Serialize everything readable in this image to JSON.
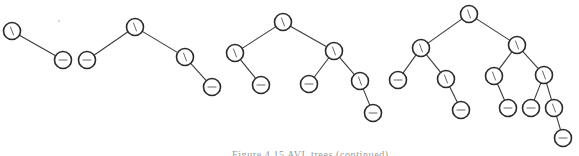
{
  "figure": {
    "caption": "Figure 4.15  AVL trees (continued)",
    "node_radius": 8.5,
    "colors": {
      "edge": "#3a3a3a",
      "node_stroke": "#2a2a2a",
      "node_fill": "#ffffff",
      "glyph": "#555555"
    },
    "glyph_legend": {
      "backslash": "right-heavy balance factor",
      "dash": "balanced"
    },
    "trees": [
      {
        "name": "tree-1",
        "nodes": [
          {
            "id": "t1-root",
            "x": 12,
            "y": 31,
            "glyph": "backslash"
          },
          {
            "id": "t1-r",
            "x": 63,
            "y": 60,
            "glyph": "dash"
          }
        ],
        "edges": [
          [
            "t1-root",
            "t1-r"
          ]
        ]
      },
      {
        "name": "tree-2",
        "nodes": [
          {
            "id": "t2-root",
            "x": 135,
            "y": 27,
            "glyph": "backslash"
          },
          {
            "id": "t2-l",
            "x": 87,
            "y": 60,
            "glyph": "dash"
          },
          {
            "id": "t2-r",
            "x": 185,
            "y": 57,
            "glyph": "backslash"
          },
          {
            "id": "t2-rr",
            "x": 212,
            "y": 87,
            "glyph": "dash"
          }
        ],
        "edges": [
          [
            "t2-root",
            "t2-l"
          ],
          [
            "t2-root",
            "t2-r"
          ],
          [
            "t2-r",
            "t2-rr"
          ]
        ]
      },
      {
        "name": "tree-3",
        "nodes": [
          {
            "id": "t3-root",
            "x": 283,
            "y": 22,
            "glyph": "backslash"
          },
          {
            "id": "t3-l",
            "x": 235,
            "y": 53,
            "glyph": "backslash"
          },
          {
            "id": "t3-lr",
            "x": 261,
            "y": 85,
            "glyph": "dash"
          },
          {
            "id": "t3-r",
            "x": 334,
            "y": 51,
            "glyph": "backslash"
          },
          {
            "id": "t3-rl",
            "x": 309,
            "y": 84,
            "glyph": "dash"
          },
          {
            "id": "t3-rr",
            "x": 360,
            "y": 81,
            "glyph": "backslash"
          },
          {
            "id": "t3-rrr",
            "x": 373,
            "y": 113,
            "glyph": "dash"
          }
        ],
        "edges": [
          [
            "t3-root",
            "t3-l"
          ],
          [
            "t3-l",
            "t3-lr"
          ],
          [
            "t3-root",
            "t3-r"
          ],
          [
            "t3-r",
            "t3-rl"
          ],
          [
            "t3-r",
            "t3-rr"
          ],
          [
            "t3-rr",
            "t3-rrr"
          ]
        ]
      },
      {
        "name": "tree-4",
        "nodes": [
          {
            "id": "t4-root",
            "x": 469,
            "y": 14,
            "glyph": "backslash"
          },
          {
            "id": "t4-l",
            "x": 421,
            "y": 48,
            "glyph": "backslash"
          },
          {
            "id": "t4-ll",
            "x": 398,
            "y": 80,
            "glyph": "dash"
          },
          {
            "id": "t4-lr",
            "x": 446,
            "y": 79,
            "glyph": "backslash"
          },
          {
            "id": "t4-lrr",
            "x": 461,
            "y": 110,
            "glyph": "dash"
          },
          {
            "id": "t4-r",
            "x": 517,
            "y": 45,
            "glyph": "backslash"
          },
          {
            "id": "t4-rl",
            "x": 494,
            "y": 76,
            "glyph": "backslash"
          },
          {
            "id": "t4-rlr",
            "x": 508,
            "y": 108,
            "glyph": "dash"
          },
          {
            "id": "t4-rr",
            "x": 544,
            "y": 75,
            "glyph": "backslash"
          },
          {
            "id": "t4-rrl",
            "x": 531,
            "y": 108,
            "glyph": "dash"
          },
          {
            "id": "t4-rrr",
            "x": 554,
            "y": 108,
            "glyph": "backslash"
          },
          {
            "id": "t4-rrrr",
            "x": 563,
            "y": 138,
            "glyph": "dash"
          }
        ],
        "edges": [
          [
            "t4-root",
            "t4-l"
          ],
          [
            "t4-l",
            "t4-ll"
          ],
          [
            "t4-l",
            "t4-lr"
          ],
          [
            "t4-lr",
            "t4-lrr"
          ],
          [
            "t4-root",
            "t4-r"
          ],
          [
            "t4-r",
            "t4-rl"
          ],
          [
            "t4-rl",
            "t4-rlr"
          ],
          [
            "t4-r",
            "t4-rr"
          ],
          [
            "t4-rr",
            "t4-rrl"
          ],
          [
            "t4-rr",
            "t4-rrr"
          ],
          [
            "t4-rrr",
            "t4-rrrr"
          ]
        ]
      }
    ]
  }
}
